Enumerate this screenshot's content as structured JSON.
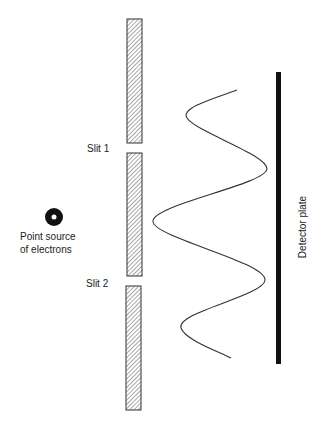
{
  "diagram": {
    "labels": {
      "slit1": "Slit 1",
      "slit2": "Slit 2",
      "source_line1": "Point source",
      "source_line2": "of electrons",
      "detector": "Detector plate"
    },
    "elements": {
      "source": {
        "cx": 54,
        "cy": 217,
        "r_outer": 9,
        "r_inner": 2.5,
        "color": "#111111"
      },
      "barriers": [
        {
          "name": "top-barrier",
          "x": 127,
          "y": 19,
          "width": 15,
          "height": 124
        },
        {
          "name": "middle-barrier",
          "x": 127,
          "y": 153,
          "width": 15,
          "height": 123
        },
        {
          "name": "bottom-barrier",
          "x": 126,
          "y": 286,
          "width": 15,
          "height": 124
        }
      ],
      "detector_plate": {
        "x": 276,
        "y": 72,
        "width": 5,
        "height": 292,
        "color": "#111111"
      },
      "interference_curve": {
        "points": [
          [
            237,
            90
          ],
          [
            187,
            116
          ],
          [
            267,
            168
          ],
          [
            153,
            223
          ],
          [
            265,
            280
          ],
          [
            181,
            327
          ],
          [
            231,
            358
          ]
        ]
      }
    },
    "colors": {
      "hatch": "#777777",
      "border": "#333333",
      "curve": "#333333",
      "text": "#222222"
    }
  }
}
